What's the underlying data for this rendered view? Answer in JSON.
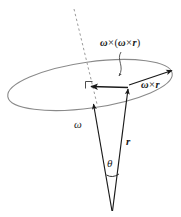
{
  "figure": {
    "labels": {
      "centripetal_term": "ω×(ω×r)",
      "tangential_term": "ω×r",
      "angular_velocity": "ω",
      "position_vector": "r",
      "angle": "θ"
    },
    "label_parts": {
      "centripetal": {
        "omega1": "ω",
        "cross1": "×",
        "open_paren": "(",
        "omega2": "ω",
        "cross2": "×",
        "r": "r",
        "close_paren": ")"
      },
      "tangential": {
        "omega": "ω",
        "cross": "×",
        "r": "r"
      }
    },
    "elements": [
      "rotation-circle-ellipse",
      "rotation-axis-dashed-line",
      "angular-velocity-vector",
      "position-vector",
      "centripetal-acceleration-vector",
      "tangential-velocity-vector",
      "right-angle-marker",
      "angle-arc",
      "leader-line"
    ],
    "colors": {
      "ellipse_stroke": "#8a8a8a",
      "vector_stroke": "#1a1a1a",
      "dashed_stroke": "#9a9a9a",
      "label_text": "#1a1a1a",
      "background": "#ffffff"
    },
    "geometry": {
      "apex": [
        112,
        212
      ],
      "omega_tip": [
        93,
        103
      ],
      "r_tip": [
        128,
        88
      ],
      "centripetal_tip": [
        90,
        87
      ],
      "tangential_tip": [
        172,
        71
      ],
      "ellipse_center": [
        90,
        85
      ],
      "ellipse_rx": 83,
      "ellipse_ry": 23,
      "ellipse_rotation_deg": -8
    }
  }
}
